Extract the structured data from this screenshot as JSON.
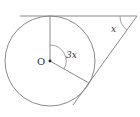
{
  "diagram": {
    "type": "geometry",
    "colors": {
      "stroke": "#8a8a8a",
      "text": "#333333",
      "background": "#ffffff"
    },
    "labels": {
      "center": "O",
      "central_angle": "3x",
      "external_angle": "x"
    },
    "elements": {
      "circle": {
        "cx": 50,
        "cy": 61,
        "r": 45
      },
      "tangent_top": {
        "x1": 20,
        "y1": 16,
        "x2": 137,
        "y2": 16
      },
      "tangent_lower": {
        "x1": 137,
        "y1": 16,
        "x2": 73,
        "y2": 105
      },
      "radius_top": {
        "x1": 50,
        "y1": 61,
        "x2": 50,
        "y2": 16
      },
      "radius_lower": {
        "x1": 50,
        "y1": 61,
        "x2": 89,
        "y2": 83
      }
    }
  }
}
